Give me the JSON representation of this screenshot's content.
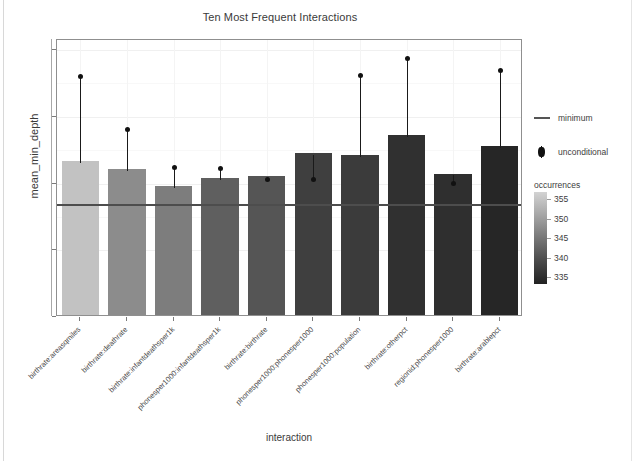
{
  "chart_data": {
    "type": "bar",
    "title": "Ten Most Frequent Interactions",
    "xlabel": "interaction",
    "ylabel": "mean_min_depth",
    "ylim": [
      0,
      4.15
    ],
    "yticks": [
      1,
      2,
      3,
      4
    ],
    "grid": true,
    "categories": [
      "birthrate:areasqmiles",
      "birthrate:deathrate",
      "birthrate:infantdeathsper1k",
      "phonesper1000:infantdeathsper1k",
      "birthrate:birthrate",
      "phonesper1000:phonesper1000",
      "phonesper1000:population",
      "birthrate:otherpct",
      "regionid:phonesper1000",
      "birthrate:arablepct"
    ],
    "values": [
      2.31,
      2.19,
      1.94,
      2.05,
      2.08,
      2.43,
      2.39,
      2.7,
      2.12,
      2.53
    ],
    "unconditional": [
      3.61,
      2.81,
      2.24,
      2.22,
      2.06,
      2.06,
      3.62,
      3.87,
      2.0,
      3.7
    ],
    "occurrences": [
      355,
      348,
      346,
      342,
      341,
      339,
      339,
      337,
      337,
      335
    ],
    "bar_colors": [
      "#c2c2c2",
      "#8c8c8c",
      "#7d7d7d",
      "#5f5f5f",
      "#555555",
      "#3f3f3f",
      "#3b3b3b",
      "#303030",
      "#2f2f2f",
      "#262626"
    ],
    "minimum_line": 1.68,
    "legend": {
      "position": "right",
      "entries": [
        {
          "key": "minimum-line",
          "label": "minimum"
        },
        {
          "key": "unconditional-point",
          "label": "unconditional"
        }
      ],
      "colorbar": {
        "title": "occurrences",
        "ticks": [
          355,
          350,
          345,
          340,
          335
        ],
        "low_color": "#222222",
        "high_color": "#d3d3d3"
      }
    }
  }
}
